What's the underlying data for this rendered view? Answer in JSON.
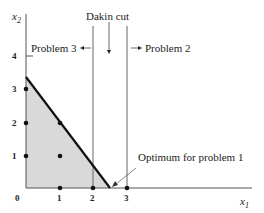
{
  "diagram": {
    "type": "integer-programming-branch-and-bound",
    "axes": {
      "x_label": "x",
      "x_sub": "1",
      "y_label": "x",
      "y_sub": "2",
      "x_ticks": [
        "0",
        "1",
        "2",
        "3"
      ],
      "y_ticks": [
        "1",
        "2",
        "3",
        "4"
      ]
    },
    "annotations": {
      "dakin_cut": "Dakin cut",
      "problem_3": "Problem 3",
      "problem_2": "Problem 2",
      "optimum": "Optimum for problem 1"
    },
    "integer_points": [
      [
        0,
        1
      ],
      [
        0,
        2
      ],
      [
        0,
        3
      ],
      [
        1,
        0
      ],
      [
        1,
        1
      ],
      [
        1,
        2
      ],
      [
        2,
        0
      ],
      [
        3,
        0
      ]
    ],
    "constraint_line": {
      "from": [
        0,
        3.33
      ],
      "to": [
        2.5,
        0
      ]
    },
    "branch_lines_x": [
      2,
      3
    ],
    "colors": {
      "feasible_region": "#d9d9d9",
      "line": "#111111",
      "axis": "#555555"
    }
  }
}
